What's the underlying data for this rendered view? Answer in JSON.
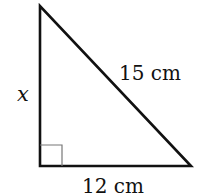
{
  "diagram": {
    "type": "right-triangle",
    "labels": {
      "left_side": "x",
      "hypotenuse": "15 cm",
      "base": "12 cm"
    },
    "right_angle_marker": true,
    "colors": {
      "stroke": "#111111",
      "marker": "#666666",
      "background": "#ffffff"
    }
  }
}
